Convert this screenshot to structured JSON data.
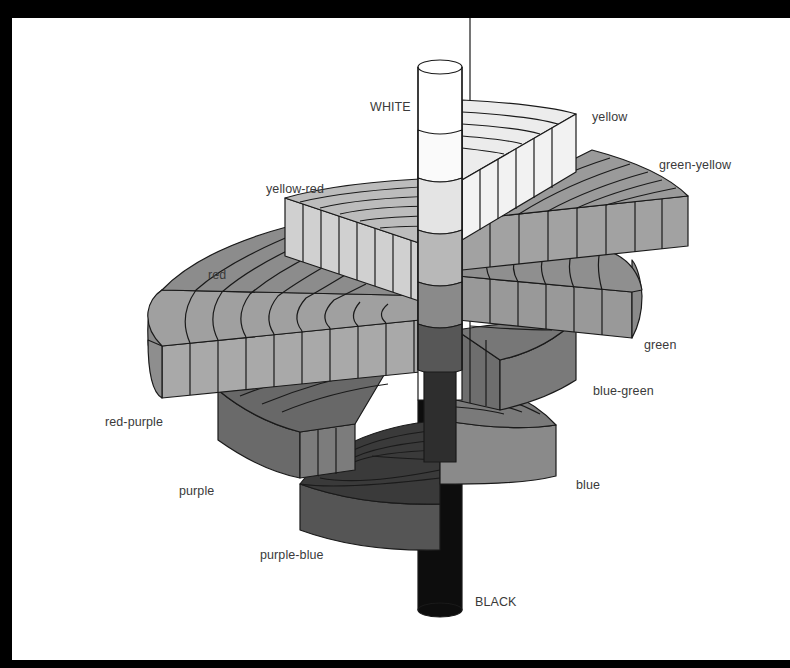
{
  "diagram": {
    "type": "munsell-color-solid",
    "axis": {
      "top_label": "WHITE",
      "bottom_label": "BLACK"
    },
    "hues": [
      {
        "id": "yellow",
        "label": "yellow"
      },
      {
        "id": "green-yellow",
        "label": "green-yellow"
      },
      {
        "id": "yellow-red",
        "label": "yellow-red"
      },
      {
        "id": "red",
        "label": "red"
      },
      {
        "id": "green",
        "label": "green"
      },
      {
        "id": "blue-green",
        "label": "blue-green"
      },
      {
        "id": "red-purple",
        "label": "red-purple"
      },
      {
        "id": "blue",
        "label": "blue"
      },
      {
        "id": "purple",
        "label": "purple"
      },
      {
        "id": "purple-blue",
        "label": "purple-blue"
      }
    ]
  }
}
